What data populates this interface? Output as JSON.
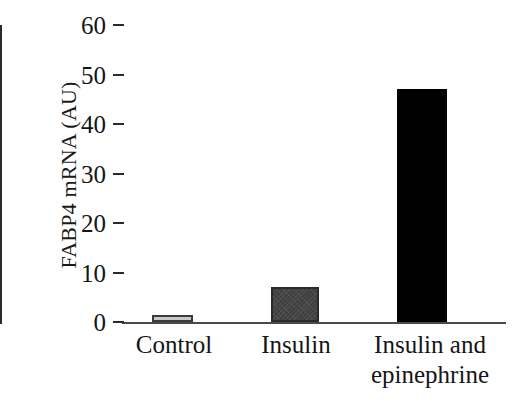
{
  "chart_data": {
    "type": "bar",
    "title": "",
    "xlabel": "",
    "ylabel": "FABP4 mRNA (AU)",
    "categories": [
      "Control",
      "Insulin",
      "Insulin and\nepinephrine"
    ],
    "values": [
      1.5,
      7,
      47
    ],
    "ylim": [
      0,
      60
    ],
    "yticks": [
      0,
      10,
      20,
      30,
      40,
      50,
      60
    ],
    "ytick_labels": [
      "0",
      "10",
      "20",
      "30",
      "40",
      "50",
      "60"
    ],
    "grid": false,
    "legend": "none",
    "bar_colors": [
      "#c9c9c9",
      "#3f3f3f",
      "#000000"
    ],
    "bar_edge_colors": [
      "#3a3a3a",
      "#2a2a2a",
      "#000000"
    ],
    "series": [
      {
        "name": "FABP4 mRNA",
        "points": [
          {
            "category": "Control",
            "value": 1.5,
            "fill": "light-gray"
          },
          {
            "category": "Insulin",
            "value": 7,
            "fill": "dark-gray"
          },
          {
            "category": "Insulin and epinephrine",
            "value": 47,
            "fill": "black"
          }
        ]
      }
    ]
  }
}
